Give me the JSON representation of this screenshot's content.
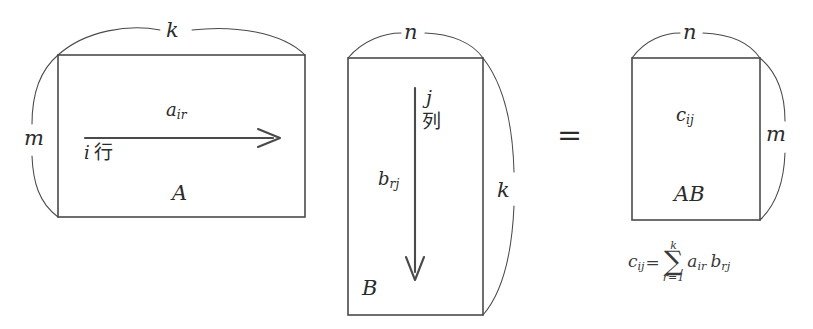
{
  "figure": {
    "type": "matrix-multiplication-diagram",
    "background_color": "#ffffff",
    "stroke_color": "#4a4a4a",
    "text_color": "#2b2b2b"
  },
  "matrix_a": {
    "name": "A",
    "rows_dim_label": "m",
    "cols_dim_label": "k",
    "entry_label": "a",
    "entry_subscript": "ir",
    "annotation_index": "i",
    "annotation_word": "行",
    "arrow_direction": "right"
  },
  "matrix_b": {
    "name": "B",
    "rows_dim_label": "k",
    "cols_dim_label": "n",
    "entry_label": "b",
    "entry_subscript": "rj",
    "annotation_index": "j",
    "annotation_word": "列",
    "arrow_direction": "down"
  },
  "operator": {
    "equals": "="
  },
  "matrix_c": {
    "name": "AB",
    "rows_dim_label": "m",
    "cols_dim_label": "n",
    "entry_label": "c",
    "entry_subscript": "ij"
  },
  "formula": {
    "lhs": "c",
    "lhs_subscript": "ij",
    "equals": "=",
    "sigma": "∑",
    "upper_limit": "k",
    "lower_limit": "r=1",
    "term1": "a",
    "term1_subscript": "ir",
    "term2": "b",
    "term2_subscript": "rj"
  }
}
